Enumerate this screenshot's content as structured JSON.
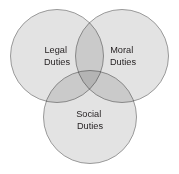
{
  "diagram": {
    "type": "venn-3-circle",
    "canvas": {
      "width": 179,
      "height": 174,
      "background": "#ffffff"
    },
    "style": {
      "fill": "#e3e3e3",
      "stroke": "#999999",
      "stroke_width": 1,
      "label_color": "#231f20",
      "label_font_size": 9.2,
      "blend": "multiply"
    },
    "circles": [
      {
        "id": "legal",
        "label_line1": "Legal",
        "label_line2": "Duties",
        "cx": 57,
        "cy": 56,
        "r": 46.5,
        "label_x": 57,
        "label_y_line1": 53,
        "label_y_line2": 65
      },
      {
        "id": "moral",
        "label_line1": "Moral",
        "label_line2": "Duties",
        "cx": 122,
        "cy": 56,
        "r": 46.5,
        "label_x": 123,
        "label_y_line1": 53,
        "label_y_line2": 65
      },
      {
        "id": "social",
        "label_line1": "Social",
        "label_line2": "Duties",
        "cx": 90,
        "cy": 117,
        "r": 46.5,
        "label_x": 90,
        "label_y_line1": 117,
        "label_y_line2": 129
      }
    ]
  }
}
